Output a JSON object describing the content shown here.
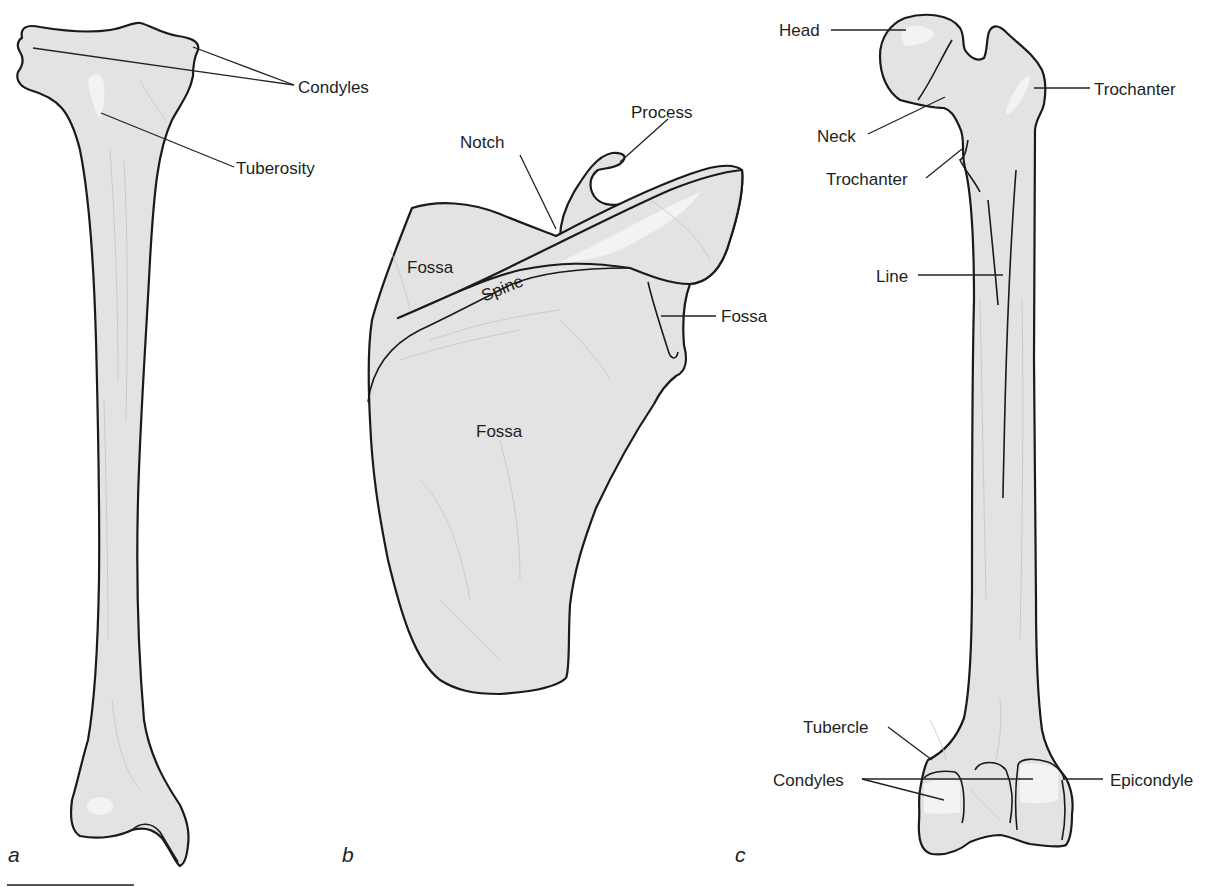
{
  "figure": {
    "panels": [
      {
        "id": "a",
        "label": "a",
        "labels": {
          "condyles": "Condyles",
          "tuberosity": "Tuberosity"
        }
      },
      {
        "id": "b",
        "label": "b",
        "labels": {
          "process": "Process",
          "notch": "Notch",
          "fossa_upper": "Fossa",
          "spine": "Spine",
          "fossa_side": "Fossa",
          "fossa_main": "Fossa"
        }
      },
      {
        "id": "c",
        "label": "c",
        "labels": {
          "head": "Head",
          "trochanter_greater": "Trochanter",
          "neck": "Neck",
          "trochanter_lesser": "Trochanter",
          "line": "Line",
          "tubercle": "Tubercle",
          "condyles": "Condyles",
          "epicondyle": "Epicondyle"
        }
      }
    ],
    "colors": {
      "bone_fill": "#e3e3e3",
      "outline": "#1a1a1a",
      "highlight": "#f3f3f3",
      "text": "#1e1e1e"
    }
  }
}
